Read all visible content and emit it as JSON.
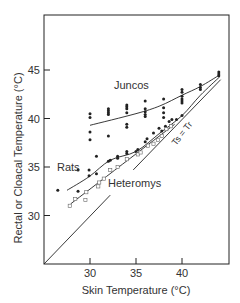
{
  "chart_data": {
    "type": "scatter",
    "title": "",
    "xlabel": "Skin Temperature (°C)",
    "ylabel": "Rectal or Cloacal Temperature (°C)",
    "xlim": [
      25,
      45.2
    ],
    "ylim": [
      25,
      50.1
    ],
    "xticks": [
      30,
      35,
      40
    ],
    "yticks": [
      30,
      35,
      40,
      45
    ],
    "grid": false,
    "legend": null,
    "annotations": [
      {
        "text": "Juncos",
        "x": 35.4,
        "y": 42.1
      },
      {
        "text": "Rats",
        "x": 27.6,
        "y": 35.1
      },
      {
        "text": "Heteromys",
        "x": 35.7,
        "y": 33.5
      },
      {
        "text": "Ts = Tr",
        "x": 39.2,
        "y": 38.3,
        "rotation": -52
      }
    ],
    "reference_line": {
      "name": "Ts = Tr",
      "segments": [
        [
          [
            25,
            25
          ],
          [
            32.2,
            32.1
          ]
        ],
        [
          [
            34.7,
            34.7
          ],
          [
            44.2,
            44.0
          ]
        ]
      ]
    },
    "series": [
      {
        "name": "Juncos",
        "marker": "filled-circle",
        "points": [
          [
            30,
            40.5
          ],
          [
            30,
            40.1
          ],
          [
            30,
            38.6
          ],
          [
            30,
            37.8
          ],
          [
            32,
            41.0
          ],
          [
            32,
            40.8
          ],
          [
            32,
            40.6
          ],
          [
            32,
            40.4
          ],
          [
            32,
            38.2
          ],
          [
            34,
            41.4
          ],
          [
            34,
            41.2
          ],
          [
            34,
            41.0
          ],
          [
            34,
            40.6
          ],
          [
            34,
            39.4
          ],
          [
            34,
            39.1
          ],
          [
            36,
            41.8
          ],
          [
            36,
            41.0
          ],
          [
            36,
            40.7
          ],
          [
            36,
            40.4
          ],
          [
            36,
            40.2
          ],
          [
            38,
            42.0
          ],
          [
            38,
            41.1
          ],
          [
            38,
            40.6
          ],
          [
            38,
            40.1
          ],
          [
            40,
            43.0
          ],
          [
            40,
            42.7
          ],
          [
            40,
            42.3
          ],
          [
            40,
            42.0
          ],
          [
            40,
            41.8
          ],
          [
            40,
            41.6
          ],
          [
            42,
            43.5
          ],
          [
            42,
            43.2
          ],
          [
            42,
            43.0
          ],
          [
            44,
            44.8
          ],
          [
            44,
            44.6
          ],
          [
            44,
            44.4
          ]
        ],
        "fit_curve": [
          [
            30,
            39.3
          ],
          [
            35,
            40.5
          ],
          [
            37.6,
            41.3
          ],
          [
            40,
            42.4
          ],
          [
            42,
            43.3
          ],
          [
            44.1,
            44.5
          ]
        ]
      },
      {
        "name": "Rats",
        "marker": "filled-circle",
        "points": [
          [
            26.5,
            32.6
          ],
          [
            28.7,
            34.7
          ],
          [
            28.7,
            32.5
          ],
          [
            29.9,
            34.7
          ],
          [
            29.9,
            34.1
          ],
          [
            30.7,
            36.1
          ],
          [
            30.7,
            34.3
          ],
          [
            32,
            35.6
          ],
          [
            32.2,
            35.7
          ],
          [
            33,
            36.1
          ],
          [
            33,
            35.9
          ],
          [
            34,
            36.6
          ],
          [
            34,
            36.4
          ],
          [
            35,
            36.6
          ],
          [
            35.2,
            36.8
          ],
          [
            36,
            37.6
          ],
          [
            36.2,
            37.9
          ],
          [
            36.9,
            38.5
          ],
          [
            37.5,
            39.0
          ],
          [
            37.8,
            38.7
          ],
          [
            38.2,
            39.2
          ],
          [
            38.6,
            39.7
          ],
          [
            38.9,
            39.9
          ],
          [
            39.4,
            39.9
          ],
          [
            40,
            40.3
          ]
        ],
        "fit_curve": [
          [
            27.5,
            32.6
          ],
          [
            29.9,
            34.0
          ],
          [
            32.2,
            35.7
          ],
          [
            35,
            36.6
          ],
          [
            37.6,
            38.5
          ],
          [
            40,
            40.3
          ],
          [
            42,
            42.4
          ],
          [
            44.1,
            44.3
          ]
        ]
      },
      {
        "name": "Heteromys",
        "marker": "open-square",
        "points": [
          [
            27.8,
            31.0
          ],
          [
            28.4,
            31.7
          ],
          [
            29.5,
            31.6
          ],
          [
            29.6,
            32.4
          ],
          [
            30.9,
            33.0
          ],
          [
            31.0,
            33.4
          ],
          [
            31.5,
            33.8
          ],
          [
            32.2,
            34.7
          ],
          [
            33.0,
            35.0
          ],
          [
            34.0,
            35.8
          ],
          [
            35.2,
            36.3
          ],
          [
            35.5,
            36.5
          ],
          [
            36.3,
            37.2
          ],
          [
            36.9,
            37.4
          ],
          [
            37.4,
            37.8
          ],
          [
            37.8,
            38.2
          ],
          [
            38.3,
            38.9
          ],
          [
            38.8,
            39.2
          ]
        ],
        "fit_curve": [
          [
            27.9,
            31.2
          ],
          [
            39.2,
            39.4
          ]
        ]
      }
    ]
  },
  "axes": {
    "x_label": "Skin Temperature (°C)",
    "y_label": "Rectal or Cloacal Temperature (°C)",
    "x_tick_labels": [
      "30",
      "35",
      "40"
    ],
    "y_tick_labels": [
      "30",
      "35",
      "40",
      "45"
    ]
  },
  "labels": {
    "juncos": "Juncos",
    "rats": "Rats",
    "heteromys": "Heteromys",
    "identity": "Ts = Tr"
  }
}
